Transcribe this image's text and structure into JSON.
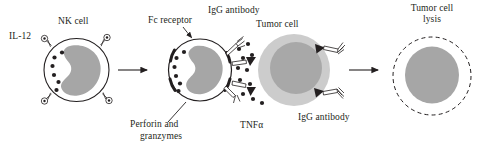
{
  "figure": {
    "type": "biological-process-diagram",
    "background_color": "#ffffff",
    "ink_color": "#231f20",
    "cytoplasm_color": "#ffffff",
    "nucleus_color": "#a6a6a6",
    "tumor_outer_color": "#cccccc",
    "tumor_nucleus_color": "#a8a8a8"
  },
  "labels": {
    "il12": "IL-12",
    "nk_cell": "NK cell",
    "fc_receptor": "Fc receptor",
    "igg_antibody_top": "IgG antibody",
    "tumor_cell": "Tumor cell",
    "tumor_cell_lysis_line1": "Tumor cell",
    "tumor_cell_lysis_line2": "lysis",
    "perforin_line1": "Perforin and",
    "perforin_line2": "granzymes",
    "tnfa": "TNFα",
    "igg_antibody_bottom": "IgG antibody"
  },
  "stages": [
    {
      "id": "stage-1",
      "name": "resting-nk-cell",
      "label": "NK cell",
      "cytokine": "IL-12",
      "receptor_count": 4,
      "granule_count": 6,
      "nucleus_shape": "kidney"
    },
    {
      "id": "stage-2",
      "name": "activated-nk-cell",
      "label": "Fc receptor",
      "secretion": [
        "Perforin and granzymes",
        "TNFα"
      ],
      "granule_count": 11,
      "fc_receptor_count": 4,
      "nucleus_shape": "kidney"
    },
    {
      "id": "stage-3",
      "name": "tumor-cell-targeted",
      "label": "Tumor cell",
      "antibody_count": 4,
      "antigen_count": 4
    },
    {
      "id": "stage-4",
      "name": "lysed-tumor-cell",
      "label": "Tumor cell lysis",
      "membrane_style": "dashed"
    }
  ],
  "arrows": [
    {
      "id": "arrow-1",
      "from": "stage-1",
      "to": "stage-2"
    },
    {
      "id": "arrow-2",
      "from": "stage-3",
      "to": "stage-4"
    }
  ]
}
